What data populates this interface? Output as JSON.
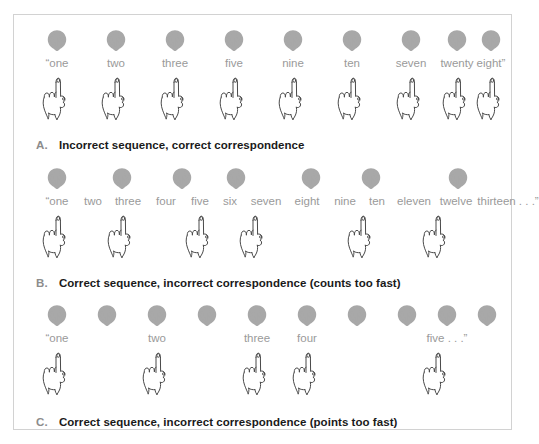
{
  "figure": {
    "panel_name": "counting-principles-figure",
    "colors": {
      "panel_border": "#d2d2d2",
      "shell_fill": "#a8a8a8",
      "word_text": "#9a9a9a",
      "caption_letter": "#8c8c8c",
      "caption_text": "#1a1a1a",
      "hand_stroke": "#4a4a4a",
      "background": "#ffffff"
    },
    "icons": {
      "shell": "scallop-shell-icon",
      "hand": "pointing-hand-icon"
    },
    "rows": [
      {
        "id": "a",
        "caption_letter": "A.",
        "caption_text": "Incorrect sequence, correct correspondence",
        "shell_count": 9,
        "shell_positions": [
          43,
          102,
          161,
          220,
          279,
          338,
          397,
          443,
          477
        ],
        "words": [
          {
            "text": "“one",
            "x": 43
          },
          {
            "text": "two",
            "x": 102
          },
          {
            "text": "three",
            "x": 161
          },
          {
            "text": "five",
            "x": 220
          },
          {
            "text": "nine",
            "x": 279
          },
          {
            "text": "ten",
            "x": 338
          },
          {
            "text": "seven",
            "x": 397
          },
          {
            "text": "twenty",
            "x": 443
          },
          {
            "text": "eight”",
            "x": 477
          }
        ],
        "hand_positions": [
          43,
          102,
          161,
          220,
          279,
          338,
          397,
          443,
          477
        ]
      },
      {
        "id": "b",
        "caption_letter": "B.",
        "caption_text": "Correct sequence, incorrect correspondence (counts too fast)",
        "shell_count": 7,
        "shell_positions": [
          43,
          108,
          168,
          222,
          297,
          357,
          444
        ],
        "words": [
          {
            "text": "“one",
            "x": 43
          },
          {
            "text": "two",
            "x": 79
          },
          {
            "text": "three",
            "x": 114
          },
          {
            "text": "four",
            "x": 152
          },
          {
            "text": "five",
            "x": 186
          },
          {
            "text": "six",
            "x": 216
          },
          {
            "text": "seven",
            "x": 252
          },
          {
            "text": "eight",
            "x": 293
          },
          {
            "text": "nine",
            "x": 331
          },
          {
            "text": "ten",
            "x": 363
          },
          {
            "text": "eleven",
            "x": 400
          },
          {
            "text": "twelve",
            "x": 442
          },
          {
            "text": "thirteen . . .”",
            "x": 494
          }
        ],
        "hand_positions": [
          43,
          108,
          186,
          240,
          348,
          423
        ]
      },
      {
        "id": "c",
        "caption_letter": "C.",
        "caption_text": "Correct sequence, incorrect correspondence (points too fast)",
        "shell_count": 10,
        "shell_positions": [
          43,
          93,
          143,
          193,
          243,
          293,
          343,
          393,
          433,
          473
        ],
        "words": [
          {
            "text": "“one",
            "x": 43
          },
          {
            "text": "two",
            "x": 143
          },
          {
            "text": "three",
            "x": 243
          },
          {
            "text": "four",
            "x": 293
          },
          {
            "text": "five . . .”",
            "x": 433
          }
        ],
        "hand_positions": [
          43,
          143,
          243,
          293,
          423
        ]
      }
    ]
  }
}
